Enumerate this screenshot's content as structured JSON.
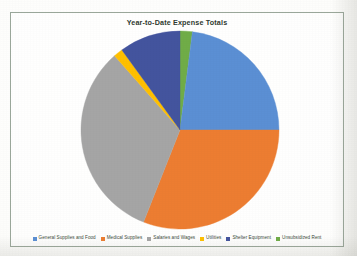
{
  "page": {
    "background_color": "#fdfdfb",
    "frame_border_color": "#9aa79a"
  },
  "chart_data": {
    "type": "pie",
    "title": "Year-to-Date Expense Totals",
    "xlabel": "",
    "ylabel": "",
    "legend_position": "bottom",
    "grid": false,
    "start_angle_deg": -90,
    "direction": "clockwise",
    "categories": [
      "General Supplies and Food",
      "Medical Supplies",
      "Salaries and Wages",
      "Utilities",
      "Shelter Equipment",
      "Unsubsidized Rent"
    ],
    "values": [
      23.0,
      31.0,
      32.5,
      1.5,
      10.0,
      2.0
    ],
    "colors": [
      "#5B8FD4",
      "#ED7D31",
      "#A5A5A5",
      "#FFC000",
      "#43549E",
      "#70AD47"
    ],
    "slice_order_clockwise_from_top": [
      {
        "label": "Unsubsidized Rent",
        "value": 2.0,
        "color": "#70AD47"
      },
      {
        "label": "General Supplies and Food",
        "value": 23.0,
        "color": "#5B8FD4"
      },
      {
        "label": "Medical Supplies",
        "value": 31.0,
        "color": "#ED7D31"
      },
      {
        "label": "Salaries and Wages",
        "value": 32.5,
        "color": "#A5A5A5"
      },
      {
        "label": "Utilities",
        "value": 1.5,
        "color": "#FFC000"
      },
      {
        "label": "Shelter Equipment",
        "value": 10.0,
        "color": "#43549E"
      }
    ]
  },
  "legend": {
    "items": [
      {
        "label": "General Supplies and Food",
        "color": "#5B8FD4"
      },
      {
        "label": "Medical Supplies",
        "color": "#ED7D31"
      },
      {
        "label": "Salaries and Wages",
        "color": "#A5A5A5"
      },
      {
        "label": "Utilities",
        "color": "#FFC000"
      },
      {
        "label": "Shelter Equipment",
        "color": "#43549E"
      },
      {
        "label": "Unsubsidized Rent",
        "color": "#70AD47"
      }
    ]
  },
  "geometry": {
    "center_x": 169,
    "center_y": 117,
    "radius": 99
  }
}
